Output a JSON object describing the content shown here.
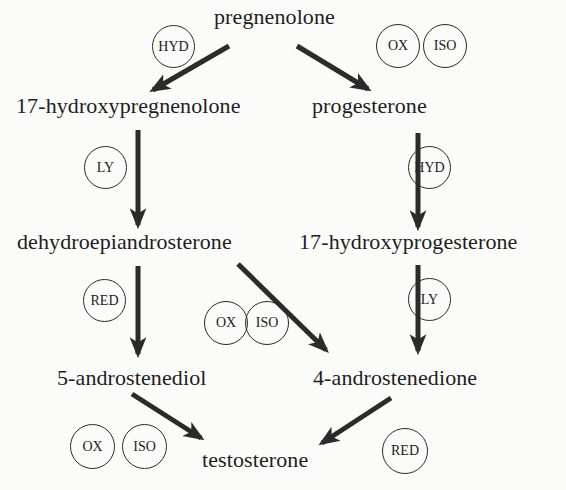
{
  "diagram": {
    "type": "biosynthesis-pathway",
    "compounds": {
      "pregnenolone": "pregnenolone",
      "hydroxypregnenolone": "17-hydroxypregnenolone",
      "progesterone": "progesterone",
      "dhea": "dehydroepiandrosterone",
      "hydroxyprogesterone": "17-hydroxyprogesterone",
      "androstenediol": "5-androstenediol",
      "androstenedione": "4-androstenedione",
      "testosterone": "testosterone"
    },
    "enzymes": {
      "hyd_1": "HYD",
      "ox_1": "OX",
      "iso_1": "ISO",
      "ly_1": "LY",
      "hyd_2": "HYD",
      "red_1": "RED",
      "ox_2": "OX",
      "iso_2": "ISO",
      "ly_2": "LY",
      "ox_3": "OX",
      "iso_3": "ISO",
      "red_2": "RED"
    },
    "edges": [
      {
        "from": "pregnenolone",
        "to": "17-hydroxypregnenolone",
        "enzymes": [
          "HYD"
        ]
      },
      {
        "from": "pregnenolone",
        "to": "progesterone",
        "enzymes": [
          "OX",
          "ISO"
        ]
      },
      {
        "from": "17-hydroxypregnenolone",
        "to": "dehydroepiandrosterone",
        "enzymes": [
          "LY"
        ]
      },
      {
        "from": "progesterone",
        "to": "17-hydroxyprogesterone",
        "enzymes": [
          "HYD"
        ]
      },
      {
        "from": "dehydroepiandrosterone",
        "to": "5-androstenediol",
        "enzymes": [
          "RED"
        ]
      },
      {
        "from": "dehydroepiandrosterone",
        "to": "4-androstenedione",
        "enzymes": [
          "OX",
          "ISO"
        ]
      },
      {
        "from": "17-hydroxyprogesterone",
        "to": "4-androstenedione",
        "enzymes": [
          "LY"
        ]
      },
      {
        "from": "5-androstenediol",
        "to": "testosterone",
        "enzymes": [
          "OX",
          "ISO"
        ]
      },
      {
        "from": "4-androstenedione",
        "to": "testosterone",
        "enzymes": [
          "RED"
        ]
      }
    ],
    "colors": {
      "background": "#fbfbfa",
      "ink": "#1e1e1e",
      "arrow": "#2b2b2b"
    }
  }
}
